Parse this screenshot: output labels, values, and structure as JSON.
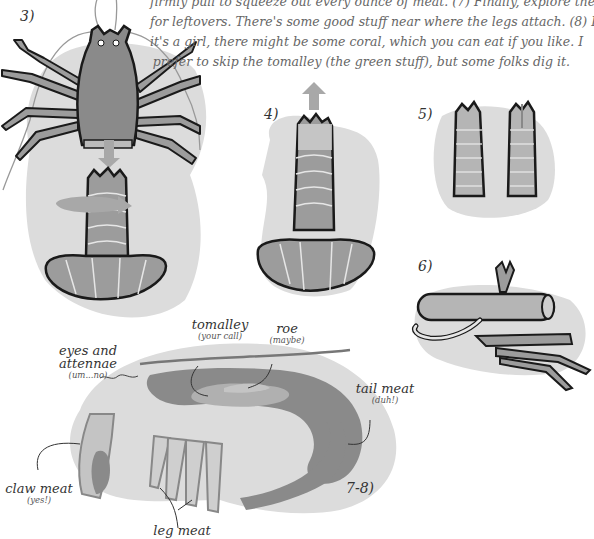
{
  "instructions": {
    "lines": [
      "firmly pull to squeeze out every ounce of meat. (7) Finally, explore the body",
      "for leftovers. There's some good stuff near where the legs attach.  (8) If",
      "it's a girl, there might be some coral, which you can eat if you like. I",
      "prefer to skip the tomalley (the green stuff), but some folks dig it."
    ]
  },
  "steps": {
    "s3": "3)",
    "s4": "4)",
    "s5": "5)",
    "s6": "6)",
    "s78": "7-8)"
  },
  "anatomy_labels": {
    "eyes": {
      "main": "eyes and attennae",
      "sub": "(um...no)"
    },
    "tomalley": {
      "main": "tomalley",
      "sub": "(your call)"
    },
    "roe": {
      "main": "roe",
      "sub": "(maybe)"
    },
    "tail": {
      "main": "tail meat",
      "sub": "(duh!)"
    },
    "claw": {
      "main": "claw meat",
      "sub": "(yes!)"
    },
    "leg": {
      "main": "leg meat"
    }
  },
  "colors": {
    "background": "#ffffff",
    "blob": "#dcdcdc",
    "shell_dark": "#8a8a8a",
    "shell_mid": "#9c9c9c",
    "meat_light": "#c4c4c4",
    "outline": "#1a1a1a",
    "arrow": "#a8a8a8"
  }
}
